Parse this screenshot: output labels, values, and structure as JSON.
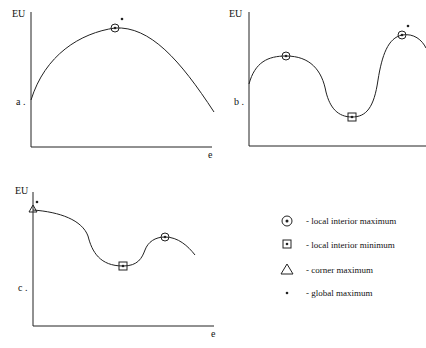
{
  "panels": [
    {
      "id": "a",
      "y_axis_label": "EU",
      "x_axis_label": "e",
      "panel_label": "a ."
    },
    {
      "id": "b",
      "y_axis_label": "EU",
      "x_axis_label": "e",
      "panel_label": "b ."
    },
    {
      "id": "c",
      "y_axis_label": "EU",
      "x_axis_label": "e",
      "panel_label": "c ."
    }
  ],
  "legend": [
    {
      "symbol": "circled-dot-icon",
      "label": "- local interior maximum"
    },
    {
      "symbol": "boxed-dot-icon",
      "label": "- local interior minimum"
    },
    {
      "symbol": "triangle-icon",
      "label": "- corner maximum"
    },
    {
      "symbol": "asterisk-icon",
      "label": "- global maximum"
    }
  ],
  "colors": {
    "ink": "#111111",
    "background": "#ffffff"
  }
}
